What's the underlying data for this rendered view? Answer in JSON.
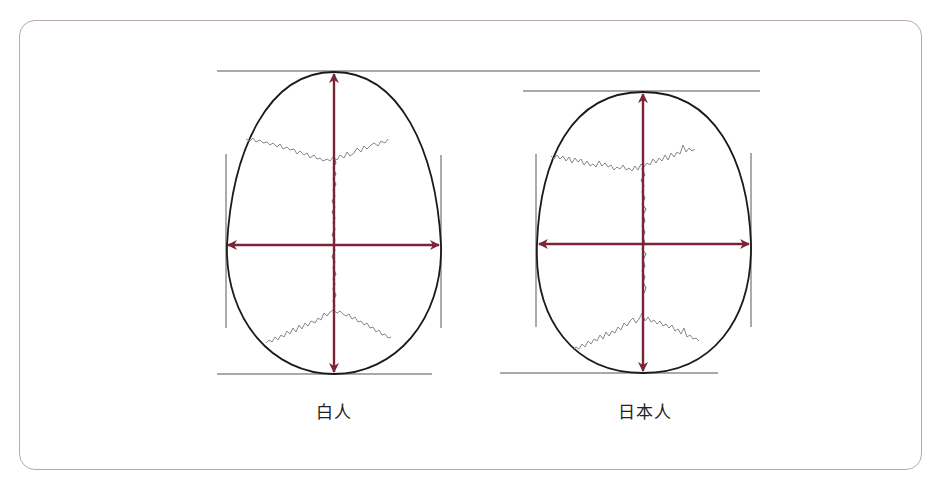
{
  "figure": {
    "type": "skull-shape-comparison",
    "arrow_color": "#7a2438",
    "outline_color": "#1a1a1a",
    "suture_color": "#888888",
    "reference_line_color": "#555555",
    "frame_color": "#b8a8ac"
  },
  "skulls": [
    {
      "label": "白人",
      "center_x": 334,
      "top_y": 72,
      "bottom_y": 374,
      "left_x": 226,
      "right_x": 441,
      "width_axis_y": 245,
      "shape": "long-oval"
    },
    {
      "label": "日本人",
      "center_x": 643,
      "top_y": 92,
      "bottom_y": 373,
      "left_x": 537,
      "right_x": 751,
      "width_axis_y": 244,
      "shape": "round-oval"
    }
  ]
}
